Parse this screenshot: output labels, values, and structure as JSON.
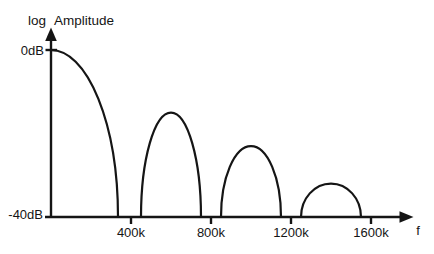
{
  "figure": {
    "background": "#ffffff",
    "ink_color": "#151515"
  },
  "chart_data": {
    "type": "line",
    "title": "",
    "ylabel": "log Amplitude",
    "xlabel": "f",
    "ylim": [
      -40,
      0
    ],
    "grid": false,
    "legend": false,
    "y_ticks": [
      {
        "dB": 0,
        "label": "0dB"
      },
      {
        "dB": -40,
        "label": "-40dB"
      }
    ],
    "x_ticks": [
      {
        "f_k": 400,
        "label": "400k"
      },
      {
        "f_k": 800,
        "label": "800k"
      },
      {
        "f_k": 1200,
        "label": "1200k"
      },
      {
        "f_k": 1600,
        "label": "1600k"
      }
    ],
    "nulls_k": [
      400,
      800,
      1200,
      1600
    ],
    "lobes": [
      {
        "start_k": 0,
        "end_k": 335,
        "peak_k": 0,
        "peak_dB": 0
      },
      {
        "start_k": 450,
        "end_k": 750,
        "peak_k": 600,
        "peak_dB": -15
      },
      {
        "start_k": 850,
        "end_k": 1150,
        "peak_k": 1000,
        "peak_dB": -23
      },
      {
        "start_k": 1250,
        "end_k": 1550,
        "peak_k": 1400,
        "peak_dB": -32
      }
    ]
  }
}
